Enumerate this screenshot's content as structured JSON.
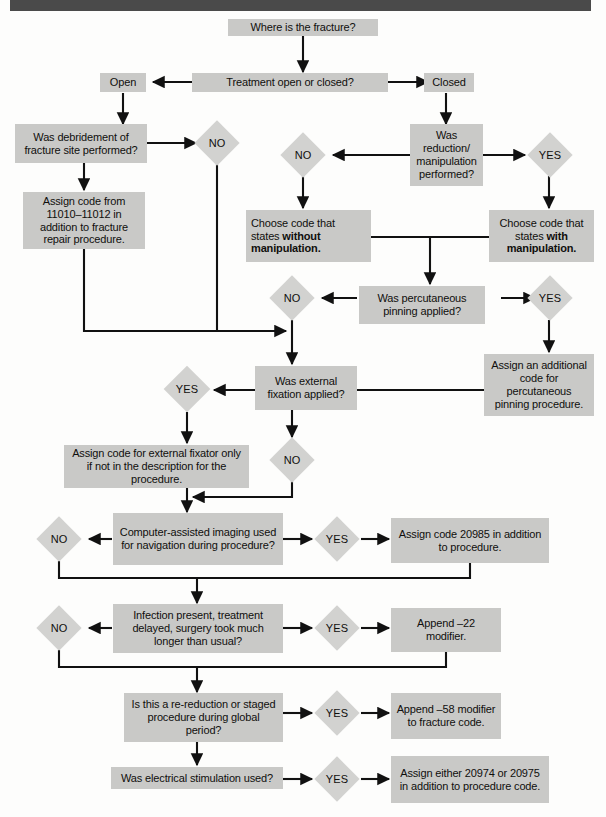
{
  "document": {
    "type": "flowchart",
    "subject": "Fracture care coding decision tree",
    "header_bar_color": "#4a4a4a",
    "box_color": "#c9c9c7",
    "diamond_color": "#d2d2d0",
    "line_color": "#111111",
    "page_background": "#fdfdfc"
  },
  "nodes": {
    "start": {
      "label": "Where is the fracture?",
      "shape": "box"
    },
    "treatment": {
      "label": "Treatment open or closed?",
      "shape": "box"
    },
    "open": {
      "label": "Open",
      "shape": "box"
    },
    "closed": {
      "label": "Closed",
      "shape": "box"
    },
    "debridement": {
      "label": "Was debridement of fracture site performed?",
      "shape": "box"
    },
    "debridement_no": {
      "label": "NO",
      "shape": "diamond"
    },
    "assign_11010": {
      "label": "Assign code from 11010–11012 in addition to fracture repair procedure.",
      "shape": "box"
    },
    "reduction": {
      "label": "Was reduction/ manipulation performed?",
      "shape": "box"
    },
    "reduction_no": {
      "label": "NO",
      "shape": "diamond"
    },
    "reduction_yes": {
      "label": "YES",
      "shape": "diamond"
    },
    "code_without": {
      "label_pre": "Choose code that states ",
      "label_bold": "without manipulation.",
      "shape": "box"
    },
    "code_with": {
      "label_pre": "Choose code that states ",
      "label_bold": "with manipulation.",
      "shape": "box"
    },
    "percutaneous": {
      "label": "Was percutaneous pinning applied?",
      "shape": "box"
    },
    "percutaneous_no": {
      "label": "NO",
      "shape": "diamond"
    },
    "percutaneous_yes": {
      "label": "YES",
      "shape": "diamond"
    },
    "assign_pinning": {
      "label": "Assign an additional code for percutaneous pinning procedure.",
      "shape": "box"
    },
    "external_fixation": {
      "label": "Was external fixation applied?",
      "shape": "box"
    },
    "external_yes": {
      "label": "YES",
      "shape": "diamond"
    },
    "external_no": {
      "label": "NO",
      "shape": "diamond"
    },
    "assign_fixator": {
      "label": "Assign code for external fixator only if not in the description for the procedure.",
      "shape": "box"
    },
    "computer_imaging": {
      "label": "Computer-assisted imaging used for navigation during procedure?",
      "shape": "box"
    },
    "imaging_no": {
      "label": "NO",
      "shape": "diamond"
    },
    "imaging_yes": {
      "label": "YES",
      "shape": "diamond"
    },
    "assign_20985": {
      "label": "Assign code 20985 in addition to procedure.",
      "shape": "box"
    },
    "infection": {
      "label": "Infection present, treatment delayed, surgery took much longer than usual?",
      "shape": "box"
    },
    "infection_no": {
      "label": "NO",
      "shape": "diamond"
    },
    "infection_yes": {
      "label": "YES",
      "shape": "diamond"
    },
    "append_22": {
      "label": "Append –22 modifier.",
      "shape": "box"
    },
    "rereduction": {
      "label": "Is this a re-reduction or staged procedure during global period?",
      "shape": "box"
    },
    "rereduction_yes": {
      "label": "YES",
      "shape": "diamond"
    },
    "append_58": {
      "label": "Append –58 modifier to fracture code.",
      "shape": "box"
    },
    "electrical": {
      "label": "Was electrical stimulation used?",
      "shape": "box"
    },
    "electrical_yes": {
      "label": "YES",
      "shape": "diamond"
    },
    "assign_20974": {
      "label": "Assign either 20974 or 20975 in addition to procedure code.",
      "shape": "box"
    }
  }
}
